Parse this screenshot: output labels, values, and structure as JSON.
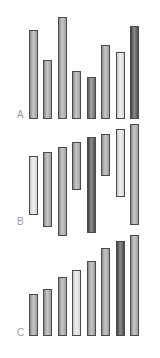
{
  "figure": {
    "panels": [
      {
        "label": "A",
        "label_pos": {
          "x": 17,
          "y": 110
        },
        "bars": [
          {
            "x": 29,
            "top": 30,
            "bottom": 119,
            "shade": "mid"
          },
          {
            "x": 43,
            "top": 60,
            "bottom": 119,
            "shade": "mid"
          },
          {
            "x": 58,
            "top": 17,
            "bottom": 119,
            "shade": "mid"
          },
          {
            "x": 72,
            "top": 71,
            "bottom": 119,
            "shade": "mid"
          },
          {
            "x": 87,
            "top": 77,
            "bottom": 119,
            "shade": "dark"
          },
          {
            "x": 101,
            "top": 45,
            "bottom": 119,
            "shade": "mid"
          },
          {
            "x": 116,
            "top": 52,
            "bottom": 119,
            "shade": "light"
          },
          {
            "x": 130,
            "top": 26,
            "bottom": 119,
            "shade": "darker"
          }
        ]
      },
      {
        "label": "B",
        "label_pos": {
          "x": 17,
          "y": 217
        },
        "bars": [
          {
            "x": 29,
            "top": 156,
            "bottom": 215,
            "shade": "light"
          },
          {
            "x": 43,
            "top": 152,
            "bottom": 227,
            "shade": "mid"
          },
          {
            "x": 58,
            "top": 147,
            "bottom": 236,
            "shade": "mid"
          },
          {
            "x": 72,
            "top": 142,
            "bottom": 190,
            "shade": "mid"
          },
          {
            "x": 87,
            "top": 137,
            "bottom": 233,
            "shade": "darker"
          },
          {
            "x": 101,
            "top": 134,
            "bottom": 176,
            "shade": "mid"
          },
          {
            "x": 116,
            "top": 129,
            "bottom": 197,
            "shade": "light"
          },
          {
            "x": 130,
            "top": 124,
            "bottom": 225,
            "shade": "mid"
          }
        ]
      },
      {
        "label": "C",
        "label_pos": {
          "x": 17,
          "y": 328
        },
        "bars": [
          {
            "x": 29,
            "top": 294,
            "bottom": 336,
            "shade": "mid"
          },
          {
            "x": 43,
            "top": 289,
            "bottom": 336,
            "shade": "mid"
          },
          {
            "x": 58,
            "top": 277,
            "bottom": 336,
            "shade": "mid"
          },
          {
            "x": 72,
            "top": 270,
            "bottom": 336,
            "shade": "light"
          },
          {
            "x": 87,
            "top": 261,
            "bottom": 336,
            "shade": "mid"
          },
          {
            "x": 101,
            "top": 248,
            "bottom": 336,
            "shade": "mid"
          },
          {
            "x": 116,
            "top": 241,
            "bottom": 336,
            "shade": "darker"
          },
          {
            "x": 130,
            "top": 235,
            "bottom": 336,
            "shade": "mid"
          }
        ]
      }
    ]
  },
  "chart_data": [
    {
      "type": "bar",
      "title": "A",
      "categories": [
        "1",
        "2",
        "3",
        "4",
        "5",
        "6",
        "7",
        "8"
      ],
      "values": [
        89,
        59,
        102,
        48,
        42,
        74,
        67,
        93
      ],
      "xlabel": "",
      "ylabel": "",
      "note": "unordered bars from common baseline (pixel heights)"
    },
    {
      "type": "bar",
      "title": "B",
      "categories": [
        "1",
        "2",
        "3",
        "4",
        "5",
        "6",
        "7",
        "8"
      ],
      "series": [
        {
          "name": "top_offset",
          "values": [
            32,
            28,
            23,
            18,
            13,
            10,
            5,
            0
          ]
        },
        {
          "name": "length",
          "values": [
            59,
            75,
            89,
            48,
            96,
            42,
            68,
            101
          ]
        }
      ],
      "note": "floating bars with staggered tops (pixel units)"
    },
    {
      "type": "bar",
      "title": "C",
      "categories": [
        "1",
        "2",
        "3",
        "4",
        "5",
        "6",
        "7",
        "8"
      ],
      "values": [
        42,
        47,
        59,
        66,
        75,
        88,
        95,
        101
      ],
      "xlabel": "",
      "ylabel": "",
      "note": "bars sorted ascending from common baseline (pixel heights)"
    }
  ]
}
